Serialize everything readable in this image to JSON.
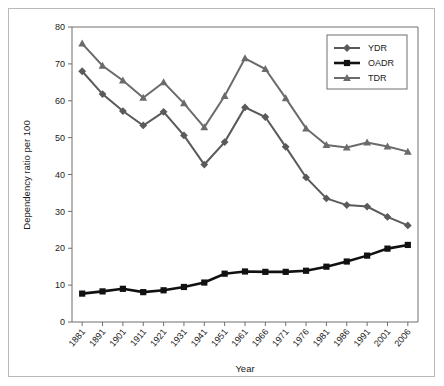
{
  "chart_data": {
    "type": "line",
    "title": "",
    "xlabel": "Year",
    "ylabel": "Dependency ratio per 100",
    "grid": false,
    "legend_position": "top-right",
    "ylim": [
      0,
      80
    ],
    "yticks": [
      0,
      10,
      20,
      30,
      40,
      50,
      60,
      70,
      80
    ],
    "ytick_labels": [
      "0",
      "10",
      "20",
      "30",
      "40",
      "50",
      "60",
      "70",
      "80"
    ],
    "categories": [
      "1881",
      "1891",
      "1901",
      "1911",
      "1921",
      "1931",
      "1941",
      "1951",
      "1961",
      "1966",
      "1971",
      "1976",
      "1981",
      "1986",
      "1991",
      "2001",
      "2006"
    ],
    "series": [
      {
        "name": "YDR",
        "marker": "diamond",
        "color": "#5a5a5a",
        "values": [
          68.0,
          61.8,
          57.2,
          53.3,
          57.0,
          50.6,
          42.7,
          48.8,
          58.2,
          55.6,
          47.5,
          39.2,
          33.5,
          31.7,
          31.3,
          28.5,
          26.2
        ]
      },
      {
        "name": "OADR",
        "marker": "square",
        "color": "#111111",
        "values": [
          7.7,
          8.3,
          9.0,
          8.1,
          8.6,
          9.5,
          10.7,
          13.1,
          13.7,
          13.6,
          13.6,
          13.9,
          15.0,
          16.4,
          18.0,
          19.9,
          20.9
        ]
      },
      {
        "name": "TDR",
        "marker": "triangle",
        "color": "#6b6b6b",
        "values": [
          75.5,
          69.5,
          65.5,
          60.8,
          65.0,
          59.3,
          52.8,
          61.3,
          71.5,
          68.6,
          60.7,
          52.5,
          48.0,
          47.3,
          48.7,
          47.6,
          46.2
        ]
      }
    ]
  },
  "legend": {
    "entries": [
      {
        "label": "YDR"
      },
      {
        "label": "OADR"
      },
      {
        "label": "TDR"
      }
    ]
  },
  "axes": {
    "x_title": "Year",
    "y_title": "Dependency ratio per 100"
  },
  "colors": {
    "ydr": "#5a5a5a",
    "oadr": "#111111",
    "tdr": "#6b6b6b",
    "axis": "#6e6e6e",
    "frame": "#b9b9b9",
    "text": "#1a1a1a",
    "background": "#ffffff"
  }
}
